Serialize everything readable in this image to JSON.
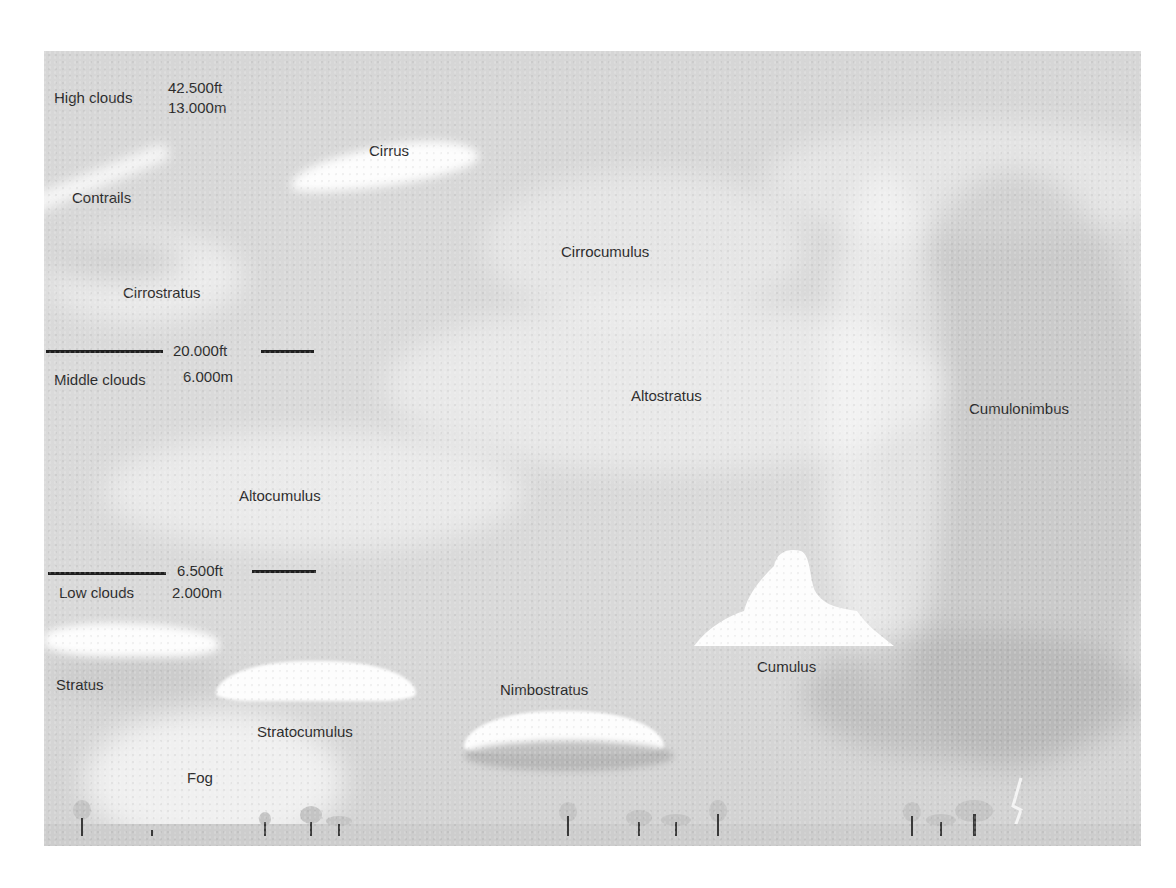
{
  "diagram": {
    "altitude_bands": [
      {
        "name": "High clouds",
        "feet": "42.500ft",
        "meters": "13.000m"
      },
      {
        "name": "Middle clouds",
        "feet": "20.000ft",
        "meters": "6.000m"
      },
      {
        "name": "Low clouds",
        "feet": "6.500ft",
        "meters": "2.000m"
      }
    ],
    "cloud_labels": {
      "cirrus": "Cirrus",
      "contrails": "Contrails",
      "cirrostratus": "Cirrostratus",
      "cirrocumulus": "Cirrocumulus",
      "altostratus": "Altostratus",
      "cumulonimbus": "Cumulonimbus",
      "altocumulus": "Altocumulus",
      "stratus": "Stratus",
      "stratocumulus": "Stratocumulus",
      "nimbostratus": "Nimbostratus",
      "cumulus": "Cumulus",
      "fog": "Fog"
    },
    "colors": {
      "sky": "#d8d8d8",
      "cloud": "#fdfdfd",
      "text": "#2b2b2b",
      "line": "#1e1e1e",
      "ground": "#cdcdcd"
    }
  }
}
